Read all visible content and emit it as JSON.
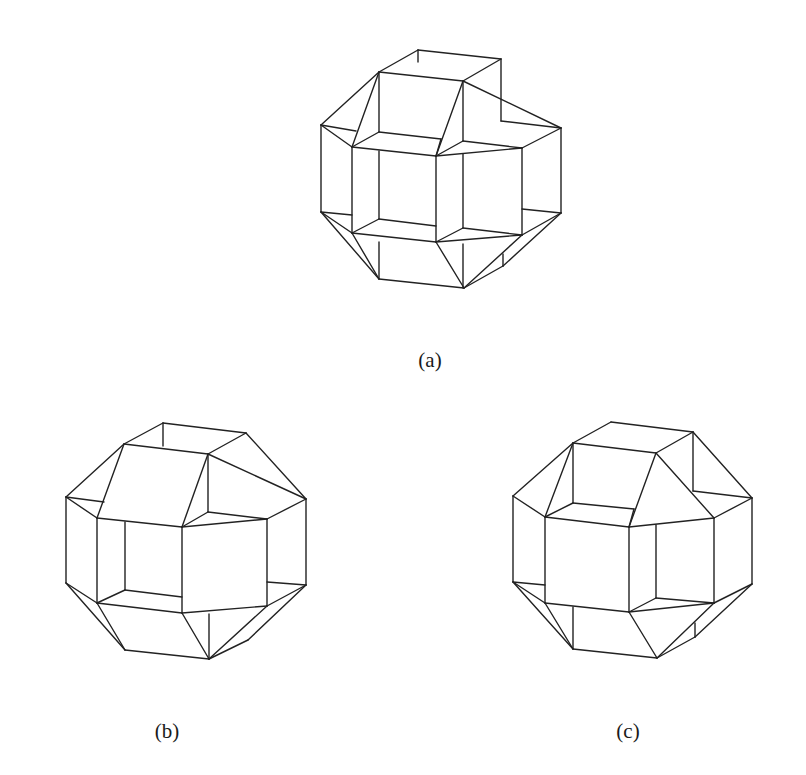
{
  "figure": {
    "background": "#ffffff",
    "line_color": "#222222",
    "panels": [
      {
        "id": "a",
        "caption": "(a)",
        "caption_pos": [
          430,
          362
        ],
        "edges": [
          [
            418,
            50,
            501,
            59
          ],
          [
            418,
            50,
            379,
            72
          ],
          [
            501,
            59,
            463,
            81
          ],
          [
            379,
            72,
            463,
            81
          ],
          [
            418,
            50,
            418,
            62
          ],
          [
            501,
            59,
            501,
            121
          ],
          [
            379,
            72,
            321,
            125
          ],
          [
            379,
            72,
            379,
            132
          ],
          [
            379,
            72,
            352,
            147
          ],
          [
            463,
            81,
            561,
            128
          ],
          [
            463,
            81,
            463,
            141
          ],
          [
            463,
            81,
            436,
            156
          ],
          [
            501,
            121,
            561,
            128
          ],
          [
            321,
            125,
            352,
            147
          ],
          [
            321,
            125,
            356,
            131
          ],
          [
            379,
            132,
            441,
            139
          ],
          [
            379,
            132,
            352,
            147
          ],
          [
            441,
            139,
            436,
            156
          ],
          [
            463,
            141,
            522,
            148
          ],
          [
            463,
            141,
            436,
            156
          ],
          [
            352,
            147,
            436,
            156
          ],
          [
            436,
            156,
            522,
            148
          ],
          [
            522,
            148,
            561,
            128
          ],
          [
            321,
            125,
            321,
            212
          ],
          [
            561,
            128,
            561,
            213
          ],
          [
            352,
            147,
            352,
            233
          ],
          [
            436,
            156,
            436,
            242
          ],
          [
            522,
            148,
            522,
            235
          ],
          [
            379,
            151,
            379,
            219
          ],
          [
            463,
            154,
            463,
            228
          ],
          [
            379,
            219,
            352,
            233
          ],
          [
            379,
            219,
            436,
            226
          ],
          [
            463,
            228,
            436,
            242
          ],
          [
            463,
            228,
            522,
            235
          ],
          [
            352,
            233,
            436,
            242
          ],
          [
            436,
            242,
            522,
            235
          ],
          [
            321,
            212,
            352,
            215
          ],
          [
            321,
            212,
            352,
            233
          ],
          [
            321,
            212,
            379,
            279
          ],
          [
            352,
            233,
            379,
            279
          ],
          [
            379,
            242,
            379,
            279
          ],
          [
            463,
            244,
            463,
            288
          ],
          [
            379,
            279,
            464,
            288
          ],
          [
            436,
            242,
            464,
            288
          ],
          [
            561,
            213,
            522,
            209
          ],
          [
            561,
            213,
            522,
            235
          ],
          [
            561,
            213,
            503,
            266
          ],
          [
            522,
            235,
            464,
            288
          ],
          [
            503,
            254,
            503,
            266
          ],
          [
            503,
            266,
            464,
            288
          ]
        ]
      },
      {
        "id": "b",
        "caption": "(b)",
        "caption_pos": [
          167,
          733
        ],
        "edges": [
          [
            163,
            423,
            246,
            433
          ],
          [
            163,
            423,
            124,
            444
          ],
          [
            246,
            433,
            208,
            454
          ],
          [
            124,
            444,
            208,
            454
          ],
          [
            163,
            423,
            163,
            446
          ],
          [
            124,
            444,
            66,
            497
          ],
          [
            124,
            444,
            97,
            518
          ],
          [
            208,
            454,
            306,
            499
          ],
          [
            246,
            433,
            306,
            499
          ],
          [
            208,
            454,
            208,
            512
          ],
          [
            208,
            454,
            182,
            527
          ],
          [
            66,
            497,
            104,
            502
          ],
          [
            66,
            497,
            97,
            518
          ],
          [
            208,
            512,
            267,
            519
          ],
          [
            208,
            512,
            182,
            527
          ],
          [
            97,
            518,
            182,
            527
          ],
          [
            182,
            527,
            267,
            519
          ],
          [
            267,
            519,
            306,
            499
          ],
          [
            66,
            497,
            66,
            583
          ],
          [
            306,
            499,
            306,
            585
          ],
          [
            97,
            518,
            97,
            603
          ],
          [
            182,
            527,
            182,
            613
          ],
          [
            267,
            519,
            267,
            606
          ],
          [
            125,
            522,
            125,
            590
          ],
          [
            125,
            590,
            97,
            603
          ],
          [
            125,
            590,
            182,
            597
          ],
          [
            97,
            603,
            182,
            613
          ],
          [
            182,
            613,
            267,
            606
          ],
          [
            267,
            582,
            306,
            585
          ],
          [
            66,
            583,
            97,
            603
          ],
          [
            66,
            583,
            125,
            650
          ],
          [
            97,
            603,
            125,
            650
          ],
          [
            125,
            650,
            209,
            659
          ],
          [
            182,
            613,
            209,
            659
          ],
          [
            209,
            614,
            209,
            659
          ],
          [
            306,
            585,
            267,
            606
          ],
          [
            306,
            585,
            248,
            640
          ],
          [
            248,
            640,
            209,
            659
          ],
          [
            267,
            606,
            209,
            659
          ]
        ]
      },
      {
        "id": "c",
        "caption": "(c)",
        "caption_pos": [
          628,
          733
        ],
        "edges": [
          [
            611,
            422,
            693,
            432
          ],
          [
            611,
            422,
            573,
            443
          ],
          [
            693,
            432,
            656,
            453
          ],
          [
            573,
            443,
            656,
            453
          ],
          [
            693,
            432,
            693,
            491
          ],
          [
            693,
            432,
            752,
            498
          ],
          [
            573,
            443,
            513,
            496
          ],
          [
            573,
            443,
            573,
            503
          ],
          [
            573,
            443,
            545,
            517
          ],
          [
            656,
            453,
            629,
            527
          ],
          [
            656,
            453,
            714,
            518
          ],
          [
            693,
            491,
            752,
            498
          ],
          [
            573,
            503,
            634,
            509
          ],
          [
            573,
            503,
            545,
            517
          ],
          [
            634,
            509,
            629,
            527
          ],
          [
            513,
            496,
            545,
            517
          ],
          [
            545,
            517,
            629,
            527
          ],
          [
            629,
            527,
            714,
            518
          ],
          [
            714,
            518,
            752,
            498
          ],
          [
            513,
            496,
            513,
            582
          ],
          [
            752,
            498,
            752,
            584
          ],
          [
            545,
            517,
            545,
            603
          ],
          [
            629,
            527,
            629,
            612
          ],
          [
            714,
            518,
            714,
            603
          ],
          [
            656,
            525,
            656,
            598
          ],
          [
            656,
            598,
            629,
            612
          ],
          [
            656,
            598,
            714,
            603
          ],
          [
            545,
            603,
            629,
            612
          ],
          [
            629,
            612,
            714,
            603
          ],
          [
            513,
            582,
            545,
            585
          ],
          [
            513,
            582,
            545,
            603
          ],
          [
            513,
            582,
            573,
            649
          ],
          [
            545,
            603,
            573,
            649
          ],
          [
            573,
            607,
            573,
            649
          ],
          [
            573,
            649,
            657,
            658
          ],
          [
            629,
            612,
            657,
            658
          ],
          [
            752,
            584,
            714,
            603
          ],
          [
            752,
            584,
            695,
            637
          ],
          [
            714,
            603,
            657,
            658
          ],
          [
            695,
            623,
            695,
            637
          ],
          [
            695,
            637,
            657,
            658
          ]
        ]
      }
    ]
  }
}
